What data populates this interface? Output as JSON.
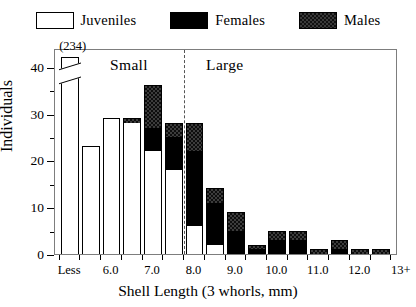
{
  "legend": {
    "position": "top-center",
    "items": [
      {
        "label": "Juveniles",
        "swatch": "white-open-rect",
        "color": "#ffffff"
      },
      {
        "label": "Females",
        "swatch": "black-filled-rect",
        "color": "#000000"
      },
      {
        "label": "Males",
        "swatch": "crosshatch-rect",
        "color": "#3c3c3c"
      }
    ]
  },
  "annotations": {
    "small_label": "Small",
    "large_label": "Large",
    "break_value_label": "(234)",
    "divider_at": "8.0"
  },
  "chart_data": {
    "type": "bar",
    "subtype": "stacked-histogram",
    "title": "",
    "xlabel": "Shell Length (3 whorls, mm)",
    "ylabel": "Individuals",
    "ylim": [
      0,
      44
    ],
    "yticks": [
      0,
      10,
      20,
      30,
      40
    ],
    "yticks_minor": [
      5,
      15,
      25,
      35
    ],
    "grid": false,
    "legend_position": "top",
    "xtick_labels": [
      "Less",
      "6.0",
      "7.0",
      "8.0",
      "9.0",
      "10.0",
      "11.0",
      "12.0",
      "13+"
    ],
    "bin_width_mm": 0.5,
    "categories": [
      "Less",
      "6.0",
      "6.5",
      "7.0",
      "7.5",
      "8.0",
      "8.5",
      "9.0",
      "9.5",
      "10.0",
      "10.5",
      "11.0",
      "11.5",
      "12.0",
      "12.5",
      "13+"
    ],
    "series": [
      {
        "name": "Juveniles",
        "color": "#ffffff",
        "values": [
          234,
          23,
          29,
          28,
          22,
          18,
          6,
          2,
          0,
          0,
          0,
          0,
          0,
          0,
          0,
          0
        ]
      },
      {
        "name": "Females",
        "color": "#000000",
        "values": [
          0,
          0,
          0,
          0,
          5,
          7,
          16,
          9,
          5,
          1,
          3,
          3,
          0,
          1,
          0,
          0
        ]
      },
      {
        "name": "Males",
        "color": "#3c3c3c",
        "values": [
          0,
          0,
          0,
          1,
          9,
          3,
          6,
          3,
          4,
          1,
          2,
          2,
          1,
          2,
          1,
          1
        ]
      }
    ],
    "totals": [
      234,
      23,
      29,
      29,
      36,
      28,
      28,
      14,
      9,
      2,
      5,
      5,
      1,
      3,
      1,
      1
    ],
    "broken_axis_bar": {
      "category": "Less",
      "true_value": 234,
      "drawn_to": 42
    }
  }
}
